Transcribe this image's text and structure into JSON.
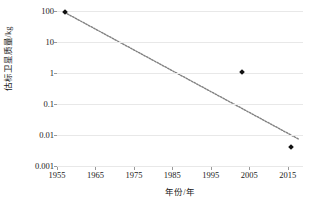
{
  "chart_data": {
    "type": "scatter",
    "title": "",
    "xlabel": "年份/年",
    "ylabel": "估标卫星质量/kg",
    "yscale": "log",
    "xscale": "linear",
    "xlim": [
      1955,
      2019
    ],
    "ylim": [
      0.001,
      100
    ],
    "grid": true,
    "legend": false,
    "x_ticks": [
      "1955",
      "1965",
      "1975",
      "1985",
      "1995",
      "2005",
      "2015"
    ],
    "x_tick_values": [
      1955,
      1965,
      1975,
      1985,
      1995,
      2005,
      2015
    ],
    "y_ticks": [
      "100",
      "10",
      "1",
      "0.1",
      "0.01",
      "0.001"
    ],
    "y_tick_values": [
      100,
      10,
      1,
      0.1,
      0.01,
      0.001
    ],
    "series": [
      {
        "name": "satellite-mass",
        "marker": "diamond",
        "color": "#111111",
        "points": [
          {
            "x": 1957,
            "y": 90
          },
          {
            "x": 2003,
            "y": 1.1
          },
          {
            "x": 2016,
            "y": 0.004
          }
        ]
      }
    ],
    "trendline": {
      "name": "fit-line",
      "style": "dotted",
      "color": "#808080",
      "start": {
        "x": 1957,
        "y": 90
      },
      "end": {
        "x": 2018,
        "y": 0.0072
      }
    }
  },
  "axes": {
    "y_title": "估标卫星质量/kg",
    "x_title": "年份/年"
  }
}
